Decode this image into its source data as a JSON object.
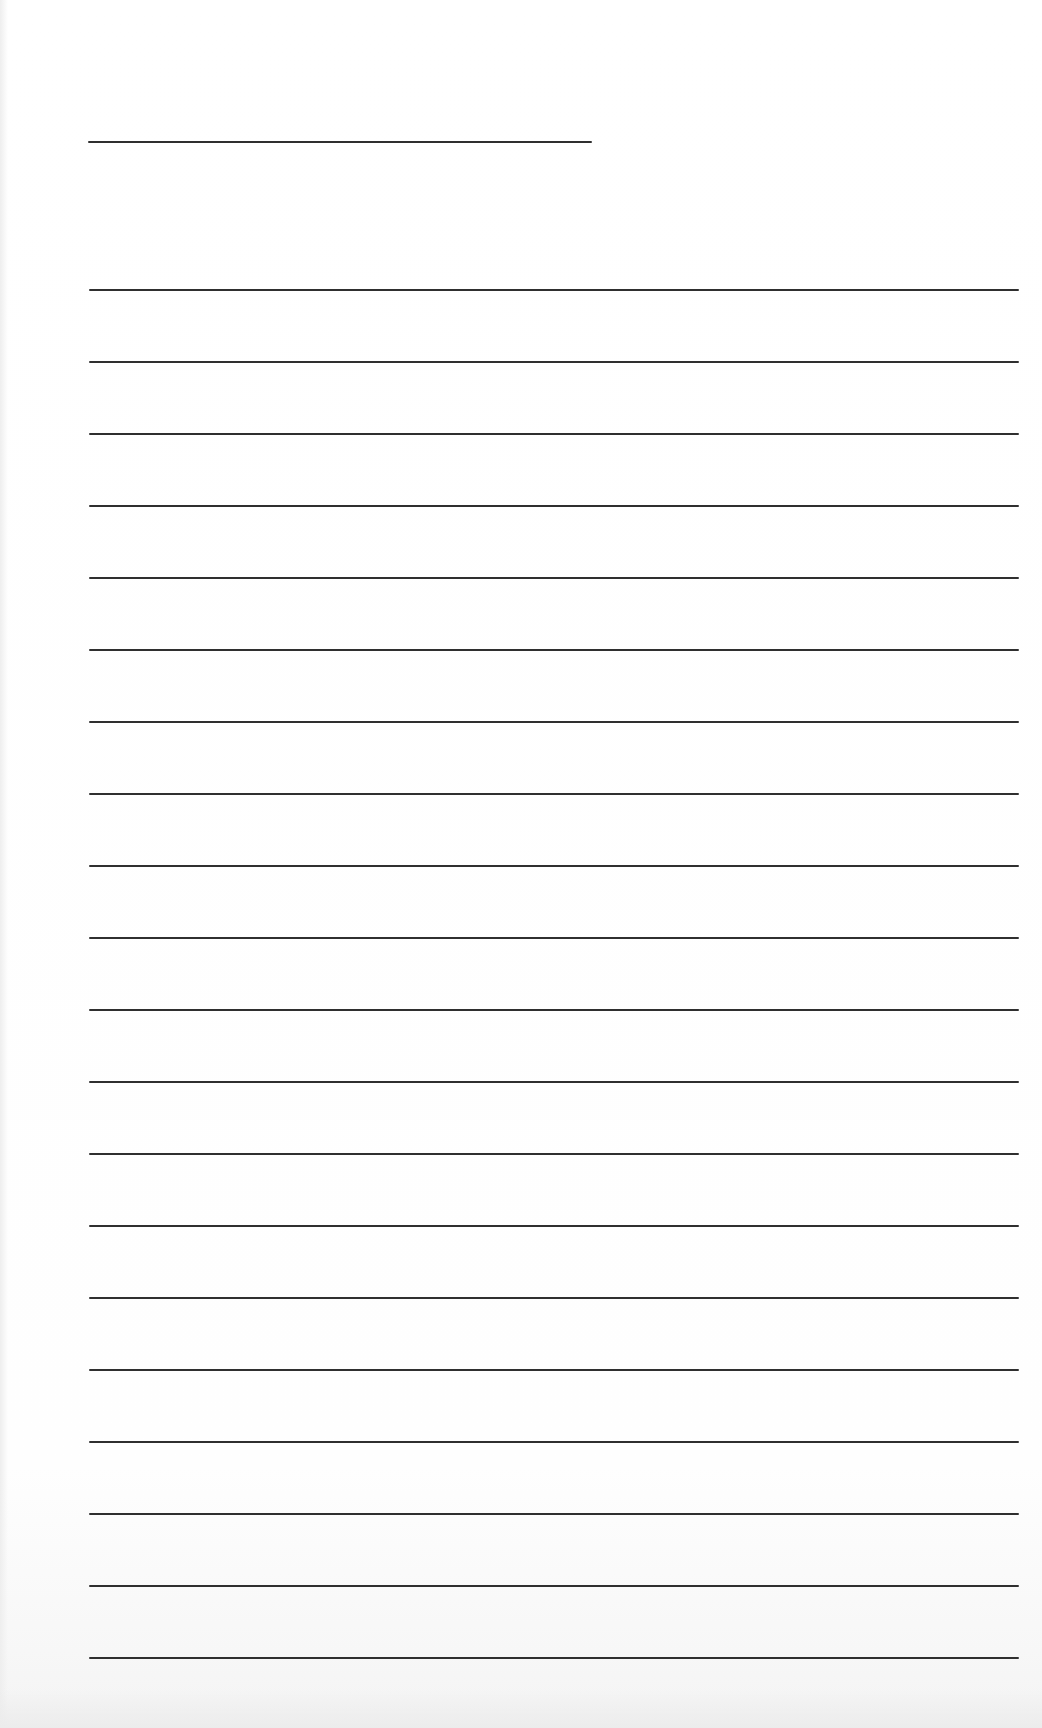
{
  "page": {
    "type": "lined-paper",
    "background": "#ffffff",
    "line_color": "#2f2f2f"
  },
  "title_line": {
    "x": 88,
    "y": 141,
    "width": 504
  },
  "ruled_lines": {
    "x": 89,
    "width": 930,
    "start_y": 289,
    "spacing": 72,
    "count": 20
  }
}
